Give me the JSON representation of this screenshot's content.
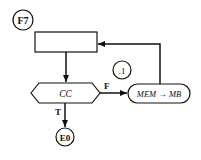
{
  "diagram": {
    "type": "flowchart",
    "nodes": {
      "entry": {
        "label": "F7",
        "shape": "circle"
      },
      "process_box": {
        "label": "",
        "shape": "rectangle"
      },
      "decision": {
        "label": "CC",
        "shape": "hexagon"
      },
      "action": {
        "label": "MEM → MB",
        "shape": "rounded-rectangle"
      },
      "connector": {
        "label": ".1",
        "shape": "circle"
      },
      "exit": {
        "label": "E0",
        "shape": "circle"
      }
    },
    "edges": {
      "false_label": "F",
      "true_label": "T"
    },
    "colors": {
      "stroke": "#111111",
      "background": "#ffffff"
    }
  }
}
